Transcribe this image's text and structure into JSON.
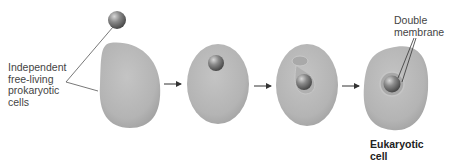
{
  "labels": {
    "prokaryotes": [
      "Independent",
      "free-living",
      "prokaryotic",
      "cells"
    ],
    "double_membrane": [
      "Double",
      "membrane"
    ],
    "eukaryotic": [
      "Eukaryotic",
      "cell"
    ]
  },
  "stages": [
    {
      "name": "separate-cells"
    },
    {
      "name": "engulfed-prokaryote"
    },
    {
      "name": "membrane-forming"
    },
    {
      "name": "eukaryotic-cell"
    }
  ],
  "colors": {
    "cell": "#b3b3b3",
    "organelle": "#7a7a7a",
    "line": "#555555"
  }
}
